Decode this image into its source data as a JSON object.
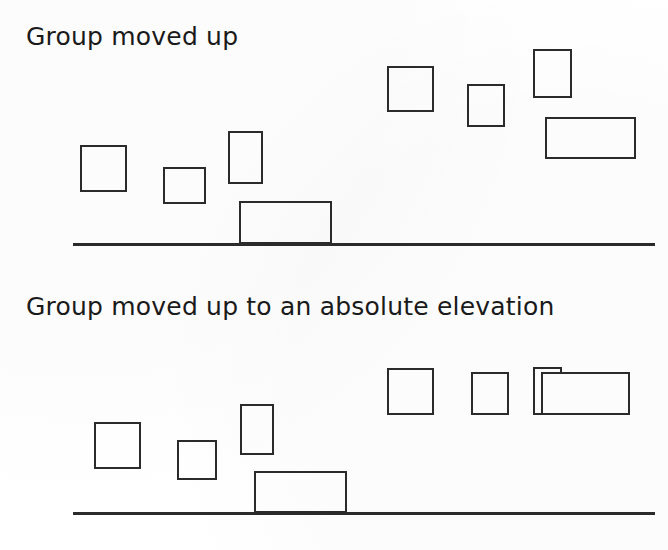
{
  "document": {
    "title": "Group moved up / Group moved up to an absolute elevation",
    "background_color": "#ffffff",
    "stroke_color": "#2b2b2b",
    "text_color": "#1a1a1a"
  },
  "panels": [
    {
      "id": "panel-top",
      "caption": "Group moved up",
      "ground": {
        "x": 73,
        "y": 243,
        "width": 582,
        "thickness": 3
      },
      "boxes": [
        {
          "name": "box-left-1",
          "x": 80,
          "y": 145,
          "width": 47,
          "height": 47
        },
        {
          "name": "box-left-2",
          "x": 163,
          "y": 167,
          "width": 43,
          "height": 37
        },
        {
          "name": "box-left-3",
          "x": 228,
          "y": 131,
          "width": 35,
          "height": 53
        },
        {
          "name": "box-left-4",
          "x": 239,
          "y": 201,
          "width": 93,
          "height": 43
        },
        {
          "name": "box-right-1",
          "x": 387,
          "y": 66,
          "width": 47,
          "height": 46
        },
        {
          "name": "box-right-2",
          "x": 467,
          "y": 84,
          "width": 38,
          "height": 43
        },
        {
          "name": "box-right-3",
          "x": 533,
          "y": 49,
          "width": 39,
          "height": 49
        },
        {
          "name": "box-right-4",
          "x": 545,
          "y": 117,
          "width": 91,
          "height": 42
        }
      ]
    },
    {
      "id": "panel-bottom",
      "caption": "Group moved up to an absolute elevation",
      "ground": {
        "x": 73,
        "y": 512,
        "width": 582,
        "thickness": 3
      },
      "boxes": [
        {
          "name": "box-left-1",
          "x": 94,
          "y": 422,
          "width": 47,
          "height": 47
        },
        {
          "name": "box-left-2",
          "x": 177,
          "y": 440,
          "width": 40,
          "height": 40
        },
        {
          "name": "box-left-3",
          "x": 240,
          "y": 404,
          "width": 34,
          "height": 51
        },
        {
          "name": "box-left-4",
          "x": 254,
          "y": 471,
          "width": 93,
          "height": 42
        },
        {
          "name": "box-right-1",
          "x": 387,
          "y": 368,
          "width": 47,
          "height": 47
        },
        {
          "name": "box-right-2",
          "x": 471,
          "y": 372,
          "width": 38,
          "height": 43
        },
        {
          "name": "box-right-3",
          "x": 533,
          "y": 367,
          "width": 29,
          "height": 48
        },
        {
          "name": "box-right-4",
          "x": 541,
          "y": 372,
          "width": 89,
          "height": 43
        }
      ]
    }
  ]
}
